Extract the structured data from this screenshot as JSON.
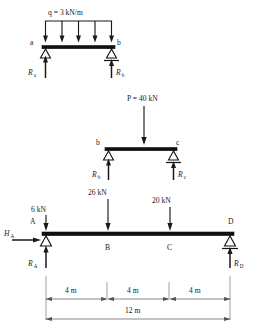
{
  "figure": {
    "background_color": "#ffffff",
    "ink_color": "#1a1a1a"
  },
  "beam1": {
    "name": "simply-supported-beam-with-udl",
    "distributed_load_label": "q = 3 kN/m",
    "distributed_load_symbol": "q",
    "distributed_load_value": "3",
    "distributed_load_unit": "kN/m",
    "arrow_count": 5,
    "left_node_label": "a",
    "right_node_label": "b",
    "left_support_type": "pin",
    "right_support_type": "roller",
    "left_reaction_label": "R",
    "left_reaction_sub": "a",
    "right_reaction_label": "R",
    "right_reaction_sub": "b"
  },
  "beam2": {
    "name": "simply-supported-beam-with-point-load",
    "point_load_label": "P = 40 kN",
    "point_load_symbol": "P",
    "point_load_value": "40",
    "point_load_unit": "kN",
    "left_node_label": "b",
    "right_node_label": "c",
    "left_support_type": "pin",
    "right_support_type": "roller",
    "left_reaction_label": "R",
    "left_reaction_sub": "b",
    "right_reaction_label": "R",
    "right_reaction_sub": "c"
  },
  "beam3": {
    "name": "main-beam-abcd",
    "nodes": [
      "A",
      "B",
      "C",
      "D"
    ],
    "node_a_label": "A",
    "node_b_label": "B",
    "node_c_label": "C",
    "node_d_label": "D",
    "loads": [
      {
        "label": "6 kN",
        "value": "6",
        "unit": "kN",
        "at": "A"
      },
      {
        "label": "26 kN",
        "value": "26",
        "unit": "kN",
        "at": "B"
      },
      {
        "label": "20 kN",
        "value": "20",
        "unit": "kN",
        "at": "C"
      }
    ],
    "load_a_label": "6 kN",
    "load_b_label": "26 kN",
    "load_c_label": "20 kN",
    "horizontal_reaction_label": "H",
    "horizontal_reaction_sub": "A",
    "left_reaction_label": "R",
    "left_reaction_sub": "A",
    "right_reaction_label": "R",
    "right_reaction_sub": "D",
    "left_support_type": "pin",
    "right_support_type": "roller"
  },
  "dimensions": {
    "segment_ab": "4 m",
    "segment_bc": "4 m",
    "segment_cd": "4 m",
    "total_span": "12 m",
    "unit": "m",
    "segment_values": [
      4,
      4,
      4
    ],
    "total_value": 12
  }
}
